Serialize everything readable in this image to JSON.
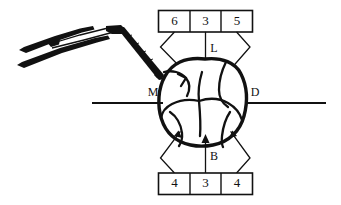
{
  "figure": {
    "ink_color": "#111111",
    "background_color": "#ffffff"
  },
  "instrument": {
    "name": "periodontal-probe",
    "description": "angled dental probe with handle and working tip"
  },
  "tooth": {
    "name": "molar-occlusal-view",
    "description": "occlusal surface of a molar tooth shown from above"
  },
  "measurement_boxes": {
    "top": {
      "label_group": "lingual-readings",
      "cells": [
        {
          "value": "6",
          "position": "mesio-lingual"
        },
        {
          "value": "3",
          "position": "mid-lingual"
        },
        {
          "value": "5",
          "position": "disto-lingual"
        }
      ]
    },
    "bottom": {
      "label_group": "buccal-readings",
      "cells": [
        {
          "value": "4",
          "position": "mesio-buccal"
        },
        {
          "value": "3",
          "position": "mid-buccal"
        },
        {
          "value": "4",
          "position": "disto-buccal"
        }
      ]
    }
  },
  "surface_labels": [
    {
      "key": "mesial",
      "text": "M"
    },
    {
      "key": "distal",
      "text": "D"
    },
    {
      "key": "lingual",
      "text": "L"
    },
    {
      "key": "buccal",
      "text": "B"
    }
  ],
  "reference_lines": {
    "mesial_line": "horizontal-rule-left",
    "distal_line": "horizontal-rule-right"
  }
}
